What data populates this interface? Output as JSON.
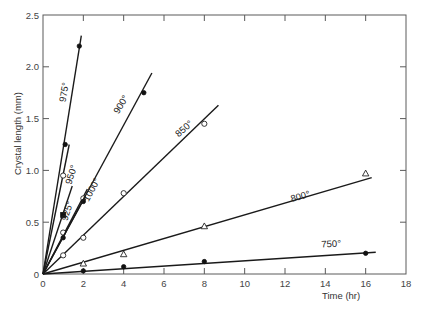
{
  "chart_data": {
    "type": "line",
    "title": "",
    "xlabel": "Time (hr)",
    "ylabel": "Crystal length (mm)",
    "xlim": [
      0,
      18
    ],
    "ylim": [
      0,
      2.5
    ],
    "x_ticks": [
      0,
      2,
      4,
      6,
      8,
      10,
      12,
      14,
      16,
      18
    ],
    "y_ticks": [
      0,
      0.5,
      1.0,
      1.5,
      2.0,
      2.5
    ],
    "x_tick_labels": [
      "0",
      "2",
      "4",
      "6",
      "8",
      "10",
      "12",
      "14",
      "16",
      "18"
    ],
    "y_tick_labels": [
      "0",
      "0.5",
      "1.0",
      "1.5",
      "2.0",
      "2.5"
    ],
    "grid": false,
    "legend": "inline labels on lines",
    "series": [
      {
        "name": "975°",
        "marker": "filled-circle",
        "points": [
          [
            1.1,
            1.25
          ],
          [
            1.8,
            2.2
          ]
        ],
        "fit_end": [
          1.9,
          2.3
        ],
        "label_pos": [
          1.2,
          1.75
        ],
        "label_angle": -80
      },
      {
        "name": "950°",
        "marker": "open-circle",
        "points": [
          [
            1.0,
            0.95
          ]
        ],
        "fit_end": [
          1.3,
          1.25
        ],
        "label_pos": [
          1.55,
          0.95
        ],
        "label_angle": -72
      },
      {
        "name": "925°",
        "marker": "filled-square",
        "points": [
          [
            1.0,
            0.57
          ]
        ],
        "fit_end": [
          1.45,
          0.85
        ],
        "label_pos": [
          1.35,
          0.6
        ],
        "label_angle": -72
      },
      {
        "name": "1000°",
        "marker": "open-circle",
        "points": [
          [
            1.0,
            0.4
          ],
          [
            2.0,
            0.73
          ]
        ],
        "fit_end": [
          2.2,
          0.82
        ],
        "label_pos": [
          2.55,
          0.8
        ],
        "label_angle": -62
      },
      {
        "name": "1000° (b)",
        "marker": "filled-circle",
        "points": [
          [
            1.0,
            0.35
          ],
          [
            2.0,
            0.7
          ]
        ],
        "fit_end": [
          2.1,
          0.75
        ],
        "label_pos": null,
        "label_angle": 0
      },
      {
        "name": "900°",
        "marker": "filled-circle",
        "points": [
          [
            5.0,
            1.75
          ]
        ],
        "fit_end": [
          5.4,
          1.94
        ],
        "label_pos": [
          4.0,
          1.62
        ],
        "label_angle": -58
      },
      {
        "name": "850°",
        "marker": "open-circle",
        "points": [
          [
            1.0,
            0.18
          ],
          [
            2.0,
            0.35
          ],
          [
            4.0,
            0.78
          ],
          [
            8.0,
            1.45
          ]
        ],
        "fit_end": [
          8.7,
          1.63
        ],
        "label_pos": [
          7.1,
          1.38
        ],
        "label_angle": -42
      },
      {
        "name": "800°",
        "marker": "open-triangle",
        "points": [
          [
            2.0,
            0.1
          ],
          [
            4.0,
            0.19
          ],
          [
            8.0,
            0.46
          ],
          [
            16.0,
            0.97
          ]
        ],
        "fit_end": [
          16.3,
          0.93
        ],
        "label_pos": [
          12.8,
          0.72
        ],
        "label_angle": -16
      },
      {
        "name": "750°",
        "marker": "filled-circle",
        "points": [
          [
            2.0,
            0.03
          ],
          [
            4.0,
            0.07
          ],
          [
            8.0,
            0.12
          ],
          [
            16.0,
            0.2
          ]
        ],
        "fit_end": [
          16.5,
          0.21
        ],
        "label_pos": [
          14.3,
          0.26
        ],
        "label_angle": -3
      }
    ]
  }
}
